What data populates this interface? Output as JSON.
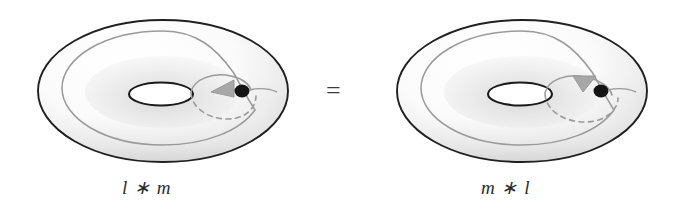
{
  "figure": {
    "type": "topology-diagram",
    "background_color": "#ffffff",
    "relation_symbol": "=",
    "panels": [
      {
        "id": "left-torus",
        "label": "l ∗ m",
        "label_parts": {
          "first": "l",
          "operator": "∗",
          "second": "m"
        },
        "center_x": 163,
        "center_y": 91,
        "outer_rx": 125,
        "outer_ry": 71,
        "hole_rx": 32,
        "hole_ry": 11,
        "basepoint_x": 240,
        "basepoint_y": 91,
        "basepoint_color": "#111111",
        "arrow_color": "#9a9a9a",
        "curve_color": "#9a9a9a",
        "outline_color": "#202020"
      },
      {
        "id": "right-torus",
        "label": "m ∗ l",
        "label_parts": {
          "first": "m",
          "operator": "∗",
          "second": "l"
        },
        "center_x": 522,
        "center_y": 91,
        "outer_rx": 125,
        "outer_ry": 71,
        "hole_rx": 32,
        "hole_ry": 11,
        "basepoint_x": 599,
        "basepoint_y": 91,
        "basepoint_color": "#111111",
        "arrow_color": "#9a9a9a",
        "curve_color": "#9a9a9a",
        "outline_color": "#202020"
      }
    ],
    "colors": {
      "outline": "#202020",
      "curve_gray": "#9a9a9a",
      "arrow_gray": "#9a9a9a",
      "dot_black": "#111111",
      "shade_light": "#f4f4f4",
      "shade_mid": "#dcdcdc",
      "text": "#2b2b2b"
    }
  }
}
